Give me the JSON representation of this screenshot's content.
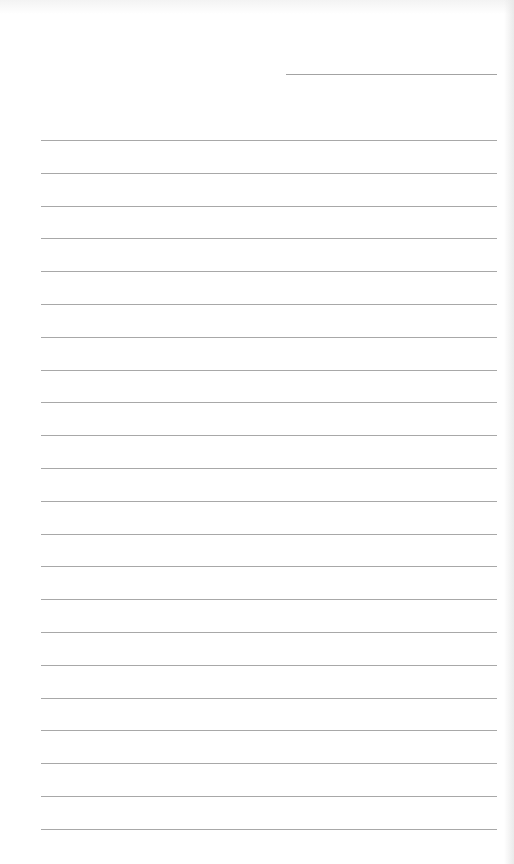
{
  "document": {
    "type": "lined-notepaper",
    "date_line": {
      "x": 286,
      "y": 74,
      "width": 211
    },
    "rules": {
      "count": 22,
      "x": 41,
      "width": 456,
      "first_y": 140,
      "spacing": 32.8
    },
    "colors": {
      "paper": "#ffffff",
      "rule": "#a8a8a8",
      "edge_shadow": "#e8e8e8"
    }
  }
}
